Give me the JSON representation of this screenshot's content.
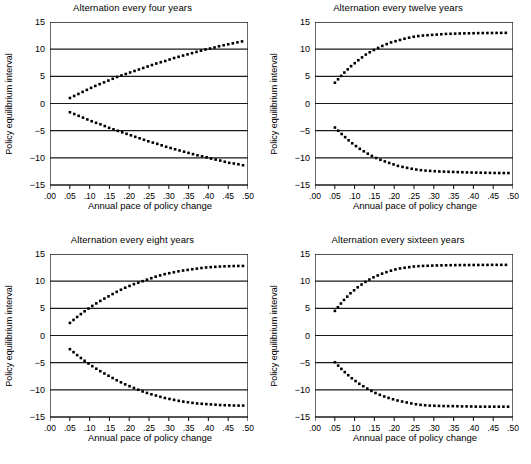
{
  "figure": {
    "panel_count": 4,
    "axis_label_x": "Annual pace of policy change",
    "axis_label_y": "Policy equilibrium interval"
  },
  "chart_data": [
    {
      "type": "line",
      "title": "Alternation every four years",
      "xlabel": "Annual pace of policy change",
      "ylabel": "Policy equilibrium interval",
      "xlim": [
        0.0,
        0.5
      ],
      "ylim": [
        -15,
        15
      ],
      "xticks": [
        ".00",
        ".05",
        ".10",
        ".15",
        ".20",
        ".25",
        ".30",
        ".35",
        ".40",
        ".45",
        ".50"
      ],
      "xtick_values": [
        0.0,
        0.05,
        0.1,
        0.15,
        0.2,
        0.25,
        0.3,
        0.35,
        0.4,
        0.45,
        0.5
      ],
      "yticks": [
        "15",
        "10",
        "5",
        "0",
        "-5",
        "-10",
        "-15"
      ],
      "ytick_values": [
        15,
        10,
        5,
        0,
        -5,
        -10,
        -15
      ],
      "grid": true,
      "grid_axis": "y",
      "legend": "none",
      "marker_style": "square-dotted",
      "x": [
        0.05,
        0.07,
        0.09,
        0.11,
        0.13,
        0.15,
        0.17,
        0.19,
        0.21,
        0.23,
        0.25,
        0.27,
        0.29,
        0.31,
        0.33,
        0.35,
        0.37,
        0.39,
        0.41,
        0.43,
        0.45,
        0.47,
        0.49
      ],
      "series": [
        {
          "name": "upper branch",
          "values": [
            1.0,
            1.7,
            2.4,
            3.1,
            3.7,
            4.3,
            4.9,
            5.4,
            5.9,
            6.4,
            6.9,
            7.4,
            7.8,
            8.3,
            8.7,
            9.1,
            9.5,
            9.9,
            10.2,
            10.6,
            10.9,
            11.2,
            11.5
          ]
        },
        {
          "name": "lower branch",
          "values": [
            -1.6,
            -2.2,
            -2.8,
            -3.4,
            -3.9,
            -4.5,
            -5.0,
            -5.5,
            -6.0,
            -6.5,
            -7.0,
            -7.4,
            -7.9,
            -8.3,
            -8.7,
            -9.1,
            -9.5,
            -9.8,
            -10.2,
            -10.5,
            -10.9,
            -11.1,
            -11.4
          ]
        }
      ]
    },
    {
      "type": "line",
      "title": "Alternation every twelve years",
      "xlabel": "Annual pace of policy change",
      "ylabel": "Policy equilibrium interval",
      "xlim": [
        0.0,
        0.5
      ],
      "ylim": [
        -15,
        15
      ],
      "xticks": [
        ".00",
        ".05",
        ".10",
        ".15",
        ".20",
        ".25",
        ".30",
        ".35",
        ".40",
        ".45",
        ".50"
      ],
      "xtick_values": [
        0.0,
        0.05,
        0.1,
        0.15,
        0.2,
        0.25,
        0.3,
        0.35,
        0.4,
        0.45,
        0.5
      ],
      "yticks": [
        "15",
        "10",
        "5",
        "0",
        "-5",
        "-10",
        "-15"
      ],
      "ytick_values": [
        15,
        10,
        5,
        0,
        -5,
        -10,
        -15
      ],
      "grid": true,
      "grid_axis": "y",
      "legend": "none",
      "marker_style": "square-dotted",
      "x": [
        0.05,
        0.07,
        0.09,
        0.11,
        0.13,
        0.15,
        0.17,
        0.19,
        0.21,
        0.23,
        0.25,
        0.27,
        0.29,
        0.31,
        0.33,
        0.35,
        0.37,
        0.39,
        0.41,
        0.43,
        0.45,
        0.47,
        0.49
      ],
      "series": [
        {
          "name": "upper branch",
          "values": [
            3.8,
            5.4,
            6.8,
            8.0,
            9.1,
            9.9,
            10.6,
            11.2,
            11.6,
            12.0,
            12.3,
            12.5,
            12.6,
            12.7,
            12.8,
            12.85,
            12.9,
            12.92,
            12.95,
            12.97,
            12.98,
            13.0,
            13.0
          ]
        },
        {
          "name": "lower branch",
          "values": [
            -4.4,
            -5.8,
            -7.1,
            -8.2,
            -9.1,
            -9.9,
            -10.5,
            -11.0,
            -11.5,
            -11.8,
            -12.1,
            -12.3,
            -12.4,
            -12.5,
            -12.55,
            -12.6,
            -12.65,
            -12.7,
            -12.72,
            -12.75,
            -12.78,
            -12.8,
            -12.8
          ]
        }
      ]
    },
    {
      "type": "line",
      "title": "Alternation every eight years",
      "xlabel": "Annual pace of policy change",
      "ylabel": "Policy equilibrium interval",
      "xlim": [
        0.0,
        0.5
      ],
      "ylim": [
        -15,
        15
      ],
      "xticks": [
        ".00",
        ".05",
        ".10",
        ".15",
        ".20",
        ".25",
        ".30",
        ".35",
        ".40",
        ".45",
        ".50"
      ],
      "xtick_values": [
        0.0,
        0.05,
        0.1,
        0.15,
        0.2,
        0.25,
        0.3,
        0.35,
        0.4,
        0.45,
        0.5
      ],
      "yticks": [
        "15",
        "10",
        "5",
        "0",
        "-5",
        "-10",
        "-15"
      ],
      "ytick_values": [
        15,
        10,
        5,
        0,
        -5,
        -10,
        -15
      ],
      "grid": true,
      "grid_axis": "y",
      "legend": "none",
      "marker_style": "square-dotted",
      "x": [
        0.05,
        0.07,
        0.09,
        0.11,
        0.13,
        0.15,
        0.17,
        0.19,
        0.21,
        0.23,
        0.25,
        0.27,
        0.29,
        0.31,
        0.33,
        0.35,
        0.37,
        0.39,
        0.41,
        0.43,
        0.45,
        0.47,
        0.49
      ],
      "series": [
        {
          "name": "upper branch",
          "values": [
            2.3,
            3.5,
            4.6,
            5.6,
            6.5,
            7.3,
            8.1,
            8.8,
            9.4,
            9.9,
            10.4,
            10.9,
            11.3,
            11.6,
            11.9,
            12.1,
            12.3,
            12.5,
            12.6,
            12.7,
            12.75,
            12.8,
            12.8
          ]
        },
        {
          "name": "lower branch",
          "values": [
            -2.5,
            -3.7,
            -4.8,
            -5.8,
            -6.7,
            -7.5,
            -8.3,
            -9.0,
            -9.6,
            -10.2,
            -10.7,
            -11.1,
            -11.5,
            -11.8,
            -12.1,
            -12.3,
            -12.5,
            -12.6,
            -12.7,
            -12.8,
            -12.85,
            -12.9,
            -12.9
          ]
        }
      ]
    },
    {
      "type": "line",
      "title": "Alternation every sixteen years",
      "xlabel": "Annual pace of policy change",
      "ylabel": "Policy equilibrium interval",
      "xlim": [
        0.0,
        0.5
      ],
      "ylim": [
        -15,
        15
      ],
      "xticks": [
        ".00",
        ".05",
        ".10",
        ".15",
        ".20",
        ".25",
        ".30",
        ".35",
        ".40",
        ".45",
        ".50"
      ],
      "xtick_values": [
        0.0,
        0.05,
        0.1,
        0.15,
        0.2,
        0.25,
        0.3,
        0.35,
        0.4,
        0.45,
        0.5
      ],
      "yticks": [
        "15",
        "10",
        "5",
        "0",
        "-5",
        "-10",
        "-15"
      ],
      "ytick_values": [
        15,
        10,
        5,
        0,
        -5,
        -10,
        -15
      ],
      "grid": true,
      "grid_axis": "y",
      "legend": "none",
      "marker_style": "square-dotted",
      "x": [
        0.05,
        0.07,
        0.09,
        0.11,
        0.13,
        0.15,
        0.17,
        0.19,
        0.21,
        0.23,
        0.25,
        0.27,
        0.29,
        0.31,
        0.33,
        0.35,
        0.37,
        0.39,
        0.41,
        0.43,
        0.45,
        0.47,
        0.49
      ],
      "series": [
        {
          "name": "upper branch",
          "values": [
            4.5,
            6.3,
            7.8,
            9.0,
            10.0,
            10.8,
            11.4,
            11.9,
            12.3,
            12.5,
            12.7,
            12.8,
            12.85,
            12.9,
            12.92,
            12.95,
            12.96,
            12.97,
            12.98,
            12.99,
            13.0,
            13.0,
            13.0
          ]
        },
        {
          "name": "lower branch",
          "values": [
            -4.9,
            -6.4,
            -7.7,
            -8.8,
            -9.7,
            -10.5,
            -11.1,
            -11.6,
            -12.0,
            -12.3,
            -12.6,
            -12.8,
            -12.9,
            -12.95,
            -13.0,
            -13.0,
            -13.05,
            -13.05,
            -13.1,
            -13.1,
            -13.1,
            -13.1,
            -13.1
          ]
        }
      ]
    }
  ]
}
